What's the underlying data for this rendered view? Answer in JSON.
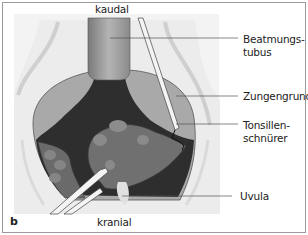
{
  "figure": {
    "panel_letter": "b",
    "orientation": {
      "top": "kaudal",
      "bottom": "kranial"
    },
    "labels": [
      {
        "id": "beatmungstubus",
        "line1": "Beatmungs-",
        "line2": "tubus"
      },
      {
        "id": "zungengrund",
        "line1": "Zungengrund",
        "line2": ""
      },
      {
        "id": "tonsillenschnuerer",
        "line1": "Tonsillen-",
        "line2": "schnürer"
      },
      {
        "id": "uvula",
        "line1": "Uvula",
        "line2": ""
      }
    ],
    "colors": {
      "frame": "#9a9a9a",
      "background_wall": "#e9e9e9",
      "tongue_base": "#a8a8a8",
      "dark_cavity": "#2e2e2e",
      "tonsil": "#6e6e6e",
      "tube": "#8f8f8f",
      "instrument": "#f2f2f2"
    }
  }
}
